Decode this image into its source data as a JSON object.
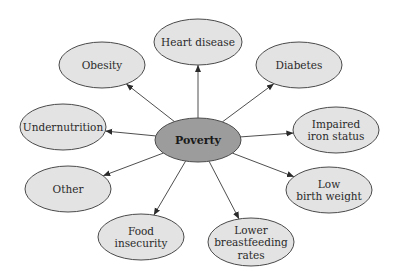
{
  "diagram": {
    "type": "hub-and-spoke",
    "center": {
      "id": "poverty",
      "label": [
        "Poverty"
      ],
      "fill": "#9c9c9c"
    },
    "node_fill": "#e3e3e3",
    "stroke_color": "#4a4a4a",
    "nodes": [
      {
        "id": "heart-disease",
        "label": [
          "Heart disease"
        ]
      },
      {
        "id": "diabetes",
        "label": [
          "Diabetes"
        ]
      },
      {
        "id": "impaired-iron-status",
        "label": [
          "Impaired",
          "iron status"
        ]
      },
      {
        "id": "low-birth-weight",
        "label": [
          "Low",
          "birth weight"
        ]
      },
      {
        "id": "lower-breastfeeding-rates",
        "label": [
          "Lower",
          "breastfeeding",
          "rates"
        ]
      },
      {
        "id": "food-insecurity",
        "label": [
          "Food",
          "insecurity"
        ]
      },
      {
        "id": "other",
        "label": [
          "Other"
        ]
      },
      {
        "id": "undernutrition",
        "label": [
          "Undernutrition"
        ]
      },
      {
        "id": "obesity",
        "label": [
          "Obesity"
        ]
      }
    ],
    "edges": [
      {
        "from": "poverty",
        "to": "heart-disease"
      },
      {
        "from": "poverty",
        "to": "diabetes"
      },
      {
        "from": "poverty",
        "to": "impaired-iron-status"
      },
      {
        "from": "poverty",
        "to": "low-birth-weight"
      },
      {
        "from": "poverty",
        "to": "lower-breastfeeding-rates"
      },
      {
        "from": "poverty",
        "to": "food-insecurity"
      },
      {
        "from": "poverty",
        "to": "other"
      },
      {
        "from": "poverty",
        "to": "undernutrition"
      },
      {
        "from": "poverty",
        "to": "obesity"
      }
    ]
  }
}
